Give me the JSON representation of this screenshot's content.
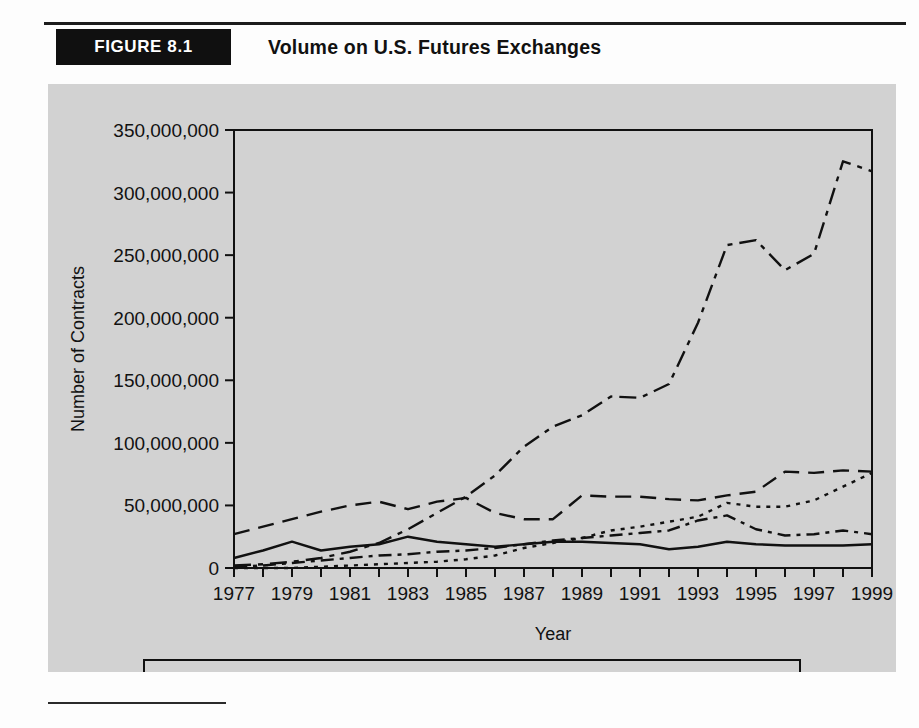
{
  "header": {
    "figure_label": "FIGURE 8.1",
    "title": "Volume on U.S. Futures Exchanges"
  },
  "chart_data": {
    "type": "line",
    "title": "Volume on U.S. Futures Exchanges",
    "xlabel": "Year",
    "ylabel": "Number of Contracts",
    "xlim": [
      1977,
      1999
    ],
    "ylim": [
      0,
      350000000
    ],
    "ytick_values": [
      0,
      50000000,
      100000000,
      150000000,
      200000000,
      250000000,
      300000000,
      350000000
    ],
    "ytick_labels": [
      "0",
      "50,000,000",
      "100,000,000",
      "150,000,000",
      "200,000,000",
      "250,000,000",
      "300,000,000",
      "350,000,000"
    ],
    "xtick_values": [
      1977,
      1979,
      1981,
      1983,
      1985,
      1987,
      1989,
      1991,
      1993,
      1995,
      1997,
      1999
    ],
    "xtick_labels": [
      "1977",
      "1979",
      "1981",
      "1983",
      "1985",
      "1987",
      "1989",
      "1991",
      "1993",
      "1995",
      "1997",
      "1999"
    ],
    "x_minor_every": 1,
    "grid": false,
    "legend_position": "below",
    "x": [
      1977,
      1978,
      1979,
      1980,
      1981,
      1982,
      1983,
      1984,
      1985,
      1986,
      1987,
      1988,
      1989,
      1990,
      1991,
      1992,
      1993,
      1994,
      1995,
      1996,
      1997,
      1998,
      1999
    ],
    "series": [
      {
        "name": "Agriculture",
        "dash": "dashed",
        "color": "#111111",
        "values": [
          27000000,
          33000000,
          39000000,
          45000000,
          50000000,
          53000000,
          47000000,
          53000000,
          56000000,
          44000000,
          39000000,
          39000000,
          58000000,
          57000000,
          57000000,
          55000000,
          54000000,
          58000000,
          61000000,
          77000000,
          76000000,
          78000000,
          77000000
        ]
      },
      {
        "name": "Energy",
        "dash": "dotted",
        "color": "#111111",
        "values": [
          0,
          0,
          0,
          1000000,
          2000000,
          3000000,
          4000000,
          5000000,
          7000000,
          10000000,
          16000000,
          20000000,
          24000000,
          30000000,
          33000000,
          37000000,
          41000000,
          52000000,
          49000000,
          49000000,
          54000000,
          65000000,
          76000000
        ]
      },
      {
        "name": "Metals",
        "dash": "solid",
        "color": "#111111",
        "values": [
          8000000,
          14000000,
          21000000,
          14000000,
          17000000,
          19000000,
          25000000,
          21000000,
          19000000,
          17000000,
          19000000,
          21000000,
          21000000,
          20000000,
          19000000,
          15000000,
          17000000,
          21000000,
          19000000,
          18000000,
          18000000,
          18000000,
          19000000
        ]
      },
      {
        "name": "Financials",
        "dash": "dashdot",
        "color": "#111111",
        "values": [
          1000000,
          2000000,
          4000000,
          6000000,
          8000000,
          10000000,
          11000000,
          13000000,
          14000000,
          16000000,
          19000000,
          22000000,
          24000000,
          26000000,
          28000000,
          30000000,
          38000000,
          42000000,
          31000000,
          26000000,
          27000000,
          30000000,
          27000000
        ]
      },
      {
        "name": "Currencies",
        "dash": "dashdotlong",
        "color": "#111111",
        "values": [
          2000000,
          3000000,
          5000000,
          8000000,
          13000000,
          20000000,
          31000000,
          44000000,
          57000000,
          74000000,
          97000000,
          113000000,
          122000000,
          137000000,
          136000000,
          147000000,
          196000000,
          258000000,
          262000000,
          238000000,
          251000000,
          325000000,
          317000000
        ]
      }
    ]
  },
  "legend": {
    "items": [
      {
        "label": "Agriculture",
        "dash": "dashed"
      },
      {
        "label": "Energy",
        "dash": "dotted"
      },
      {
        "label": "Metals",
        "dash": "solid"
      },
      {
        "label": "Financials",
        "dash": "dashdot"
      },
      {
        "label": "Currencies",
        "dash": "dashdotlong"
      }
    ]
  }
}
